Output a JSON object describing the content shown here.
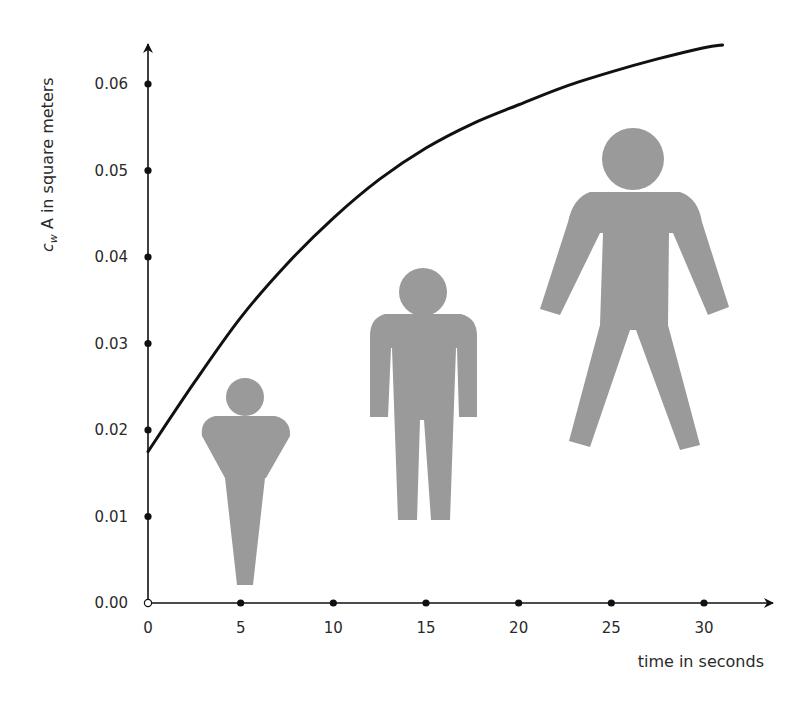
{
  "chart_data": {
    "type": "line",
    "title": "",
    "xlabel": "time in seconds",
    "ylabel_prefix": "c",
    "ylabel_subscript": "w",
    "ylabel_rest": " A in square meters",
    "xlim": [
      0,
      30
    ],
    "ylim": [
      0.0,
      0.06
    ],
    "xticks": [
      0,
      5,
      10,
      15,
      20,
      25,
      30
    ],
    "xtick_labels": [
      "0",
      "5",
      "10",
      "15",
      "20",
      "25",
      "30"
    ],
    "yticks": [
      0.0,
      0.01,
      0.02,
      0.03,
      0.04,
      0.05,
      0.06
    ],
    "ytick_labels": [
      "0.00",
      "0.01",
      "0.02",
      "0.03",
      "0.04",
      "0.05",
      "0.06"
    ],
    "grid": false,
    "legend": "none",
    "series": [
      {
        "name": "cw A",
        "color": "#111111",
        "x": [
          0,
          2.5,
          5,
          7.5,
          10,
          12.5,
          15,
          17.5,
          20,
          22.5,
          25,
          27.5,
          30,
          31
        ],
        "y": [
          0.0175,
          0.0255,
          0.033,
          0.0392,
          0.0445,
          0.049,
          0.0526,
          0.0554,
          0.0576,
          0.0597,
          0.0614,
          0.0629,
          0.0642,
          0.0645
        ]
      }
    ],
    "annotations": [
      {
        "type": "human-figure",
        "description": "child (infant) silhouette",
        "near_x": 5
      },
      {
        "type": "human-figure",
        "description": "standing adult silhouette",
        "near_x": 15
      },
      {
        "type": "human-figure",
        "description": "spread-arms adult silhouette",
        "near_x": 26
      }
    ]
  },
  "colors": {
    "axis": "#111111",
    "curve": "#111111",
    "figure": "#9a9a9a"
  }
}
